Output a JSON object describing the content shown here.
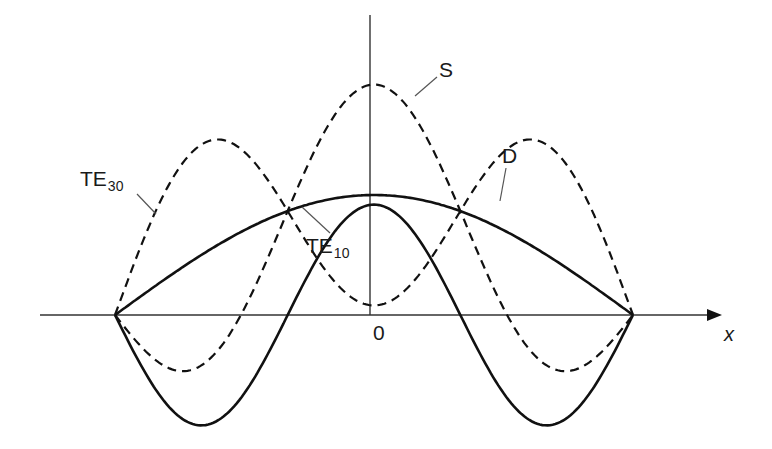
{
  "figure": {
    "title": "",
    "background": "#ffffff",
    "stroke_color": "#111111",
    "leader_color": "#555555"
  },
  "axes": {
    "x_label": "x",
    "origin_label": "0",
    "x_axis": {
      "y_px": 315,
      "x_start_px": 40,
      "x_end_px": 722
    },
    "y_axis": {
      "x_px": 370,
      "y_top_px": 15,
      "y_bottom_px": 315
    }
  },
  "labels": {
    "te30": {
      "base": "TE",
      "sub": "30"
    },
    "te10": {
      "base": "TE",
      "sub": "10"
    },
    "s": "S",
    "d": "D"
  },
  "chart_data": {
    "type": "line",
    "title": "",
    "xlabel": "x",
    "ylabel": "",
    "domain": [
      -1,
      1
    ],
    "grid": false,
    "legend": "inline leader-line labels",
    "series": [
      {
        "name": "TE10",
        "style": "solid",
        "formula": "cos(pi*x/2)",
        "amplitude": 1.0,
        "points": [
          [
            -1,
            0
          ],
          [
            -0.5,
            0.71
          ],
          [
            0,
            1.0
          ],
          [
            0.5,
            0.71
          ],
          [
            1,
            0
          ]
        ]
      },
      {
        "name": "TE30",
        "style": "solid",
        "formula": "cos(3*pi*x/2)",
        "amplitude": 0.92,
        "points": [
          [
            -1,
            0
          ],
          [
            -0.667,
            0.92
          ],
          [
            -0.333,
            0
          ],
          [
            0,
            -0.92
          ],
          [
            0.333,
            0
          ],
          [
            0.667,
            0.92
          ],
          [
            1,
            0
          ]
        ]
      },
      {
        "name": "S",
        "style": "dashed",
        "formula": "TE10 + TE30",
        "points": [
          [
            -1,
            0
          ],
          [
            -0.79,
            -0.58
          ],
          [
            -0.5,
            0.06
          ],
          [
            0,
            1.92
          ],
          [
            0.5,
            0.06
          ],
          [
            0.79,
            -0.58
          ],
          [
            1,
            0
          ]
        ]
      },
      {
        "name": "D",
        "style": "dashed",
        "formula": "TE10 - TE30",
        "points": [
          [
            -1,
            0
          ],
          [
            -0.5,
            -0.92
          ],
          [
            0,
            0
          ],
          [
            0.5,
            0.92
          ],
          [
            1,
            0
          ]
        ]
      }
    ]
  }
}
